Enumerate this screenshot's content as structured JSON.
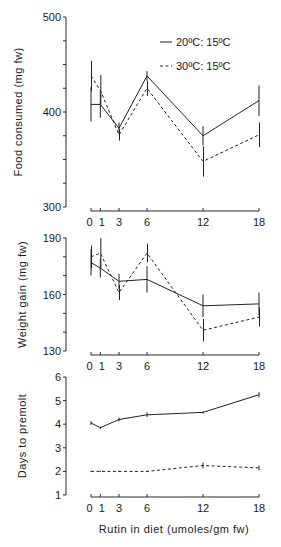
{
  "chart_data": [
    {
      "type": "line",
      "title": "",
      "xlabel": "",
      "ylabel": "Food consumed (mg fw)",
      "x": [
        0,
        1,
        3,
        6,
        12,
        18
      ],
      "x_tick_labels": [
        "0",
        "1",
        "3",
        "6",
        "12",
        "18"
      ],
      "ylim": [
        300,
        500
      ],
      "y_tick_labels": [
        "300",
        "400",
        "500"
      ],
      "legend": [
        "20ºC: 15ºC",
        "30ºC: 15ºC"
      ],
      "legend_position": "upper right",
      "series": [
        {
          "name": "20ºC: 15ºC",
          "style": "solid",
          "values": [
            408,
            408,
            383,
            438,
            375,
            412
          ],
          "error": [
            18,
            14,
            6,
            5,
            10,
            16
          ]
        },
        {
          "name": "30ºC: 15ºC",
          "style": "dashed",
          "values": [
            438,
            423,
            376,
            425,
            348,
            376
          ],
          "error": [
            16,
            16,
            6,
            8,
            16,
            13
          ]
        }
      ]
    },
    {
      "type": "line",
      "title": "",
      "xlabel": "",
      "ylabel": "Weight gain (mg fw)",
      "x": [
        0,
        1,
        3,
        6,
        12,
        18
      ],
      "x_tick_labels": [
        "0",
        "1",
        "3",
        "6",
        "12",
        "18"
      ],
      "ylim": [
        130,
        190
      ],
      "y_tick_labels": [
        "130",
        "160",
        "190"
      ],
      "series": [
        {
          "name": "20ºC: 15ºC",
          "style": "solid",
          "values": [
            177,
            174,
            167,
            168,
            154,
            155
          ],
          "error": [
            7,
            5,
            4,
            7,
            6,
            6
          ]
        },
        {
          "name": "30ºC: 15ºC",
          "style": "dashed",
          "values": [
            180,
            182,
            161,
            182,
            141,
            148
          ],
          "error": [
            6,
            8,
            4,
            5,
            6,
            5
          ]
        }
      ]
    },
    {
      "type": "line",
      "title": "",
      "xlabel": "Rutin in diet (umoles/gm fw)",
      "ylabel": "Days to premolt",
      "x": [
        0,
        1,
        3,
        6,
        12,
        18
      ],
      "x_tick_labels": [
        "0",
        "1",
        "3",
        "6",
        "12",
        "18"
      ],
      "ylim": [
        1,
        6
      ],
      "y_tick_labels": [
        "1",
        "2",
        "3",
        "4",
        "5",
        "6"
      ],
      "series": [
        {
          "name": "20ºC: 15ºC",
          "style": "solid",
          "values": [
            4.05,
            3.85,
            4.2,
            4.4,
            4.5,
            5.25
          ],
          "error": [
            0.08,
            0.05,
            0.08,
            0.1,
            0.05,
            0.12
          ]
        },
        {
          "name": "30ºC: 15ºC",
          "style": "dashed",
          "values": [
            2.0,
            2.0,
            2.0,
            2.0,
            2.25,
            2.15
          ],
          "error": [
            0.03,
            0.03,
            0.03,
            0.03,
            0.12,
            0.1
          ]
        }
      ]
    }
  ]
}
